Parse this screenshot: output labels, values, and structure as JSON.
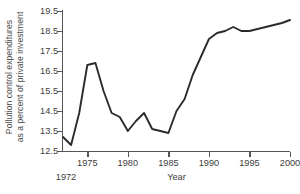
{
  "chart_data": {
    "type": "line",
    "title": "",
    "xlabel": "Year",
    "ylabel": "Pollution control expenditures as a percent of private investment",
    "ylabel_lines": [
      "Pollution control expenditures",
      "as a percent of private investment"
    ],
    "xlim": [
      1972,
      2000
    ],
    "ylim": [
      12.5,
      19.5
    ],
    "grid": false,
    "legend": null,
    "x_tick_labels": [
      "1975",
      "1980",
      "1985",
      "1990",
      "1995",
      "2000"
    ],
    "x_ticks": [
      1975,
      1980,
      1985,
      1990,
      1995,
      2000
    ],
    "x_start_label": "1972",
    "y_tick_labels": [
      "19.5",
      "18.5",
      "17.5",
      "16.5",
      "15.5",
      "14.5",
      "13.5",
      "12.5"
    ],
    "y_ticks": [
      19.5,
      18.5,
      17.5,
      16.5,
      15.5,
      14.5,
      13.5,
      12.5
    ],
    "line_color": "#2b2b2b",
    "axis_color": "#555555",
    "background_color": "#ffffff",
    "x": [
      1972,
      1973,
      1974,
      1975,
      1976,
      1977,
      1978,
      1979,
      1980,
      1981,
      1982,
      1983,
      1984,
      1985,
      1986,
      1987,
      1988,
      1989,
      1990,
      1991,
      1992,
      1993,
      1994,
      1995,
      1996,
      1997,
      1998,
      1999,
      2000
    ],
    "values": [
      13.2,
      12.8,
      14.4,
      16.8,
      16.9,
      15.5,
      14.4,
      14.2,
      13.5,
      14.0,
      14.4,
      13.6,
      13.5,
      13.4,
      14.5,
      15.1,
      16.3,
      17.2,
      18.1,
      18.4,
      18.5,
      18.7,
      18.5,
      18.5,
      18.6,
      18.7,
      18.8,
      18.9,
      19.05
    ],
    "series": [
      {
        "name": "Pollution control expenditures as a percent of private investment",
        "values": [
          13.2,
          12.8,
          14.4,
          16.8,
          16.9,
          15.5,
          14.4,
          14.2,
          13.5,
          14.0,
          14.4,
          13.6,
          13.5,
          13.4,
          14.5,
          15.1,
          16.3,
          17.2,
          18.1,
          18.4,
          18.5,
          18.7,
          18.5,
          18.5,
          18.6,
          18.7,
          18.8,
          18.9,
          19.05
        ]
      }
    ]
  }
}
